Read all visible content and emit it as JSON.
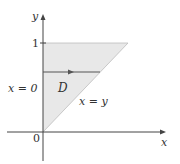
{
  "diagram": {
    "region_label": "D",
    "axes": {
      "x_label": "x",
      "y_label": "y",
      "origin_label": "0",
      "y_tick_label": "1"
    },
    "boundaries": {
      "left": "x = 0",
      "right": "x = y"
    },
    "colors": {
      "region_fill": "#e8e8e8",
      "axis": "#444444",
      "boundary": "#555555"
    }
  }
}
